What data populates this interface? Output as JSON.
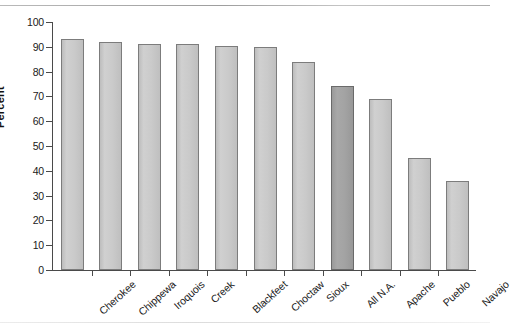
{
  "chart_data": {
    "type": "bar",
    "title": "",
    "subtitle": "",
    "xlabel": "",
    "ylabel": "Percent",
    "ylim": [
      0,
      100
    ],
    "yticks": [
      0,
      10,
      20,
      30,
      40,
      50,
      60,
      70,
      80,
      90,
      100
    ],
    "grid": false,
    "legend": null,
    "categories": [
      "Cherokee",
      "Chippewa",
      "Iroquois",
      "Creek",
      "Blackfeet",
      "Choctaw",
      "Sioux",
      "All N.A.",
      "Apache",
      "Pueblo",
      "Navajo"
    ],
    "values": [
      93,
      92,
      91,
      91,
      90.5,
      90,
      84,
      74,
      69,
      45,
      36
    ],
    "highlight_category": "All N.A.",
    "colors": {
      "bar": "#c9c9c9",
      "bar_highlight": "#a2a2a2",
      "bar_border": "#7c7c7c",
      "axis": "#4a4a4a",
      "text": "#1a1a1a",
      "background": "#ffffff"
    }
  }
}
